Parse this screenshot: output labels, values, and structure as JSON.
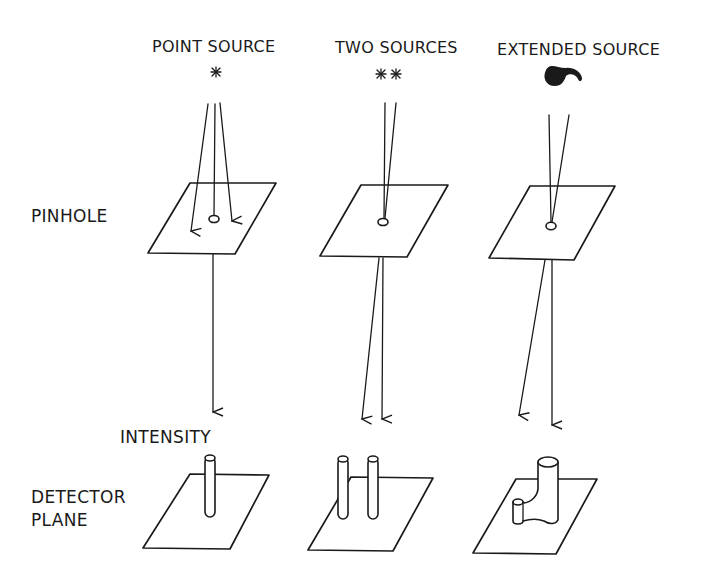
{
  "diagram": {
    "columns": [
      {
        "title": "POINT SOURCE",
        "source_glyph": "✳",
        "source_type": "asterisk-icon"
      },
      {
        "title": "TWO SOURCES",
        "source_glyph": "✳✳",
        "source_type": "double-asterisk-icon"
      },
      {
        "title": "EXTENDED SOURCE",
        "source_glyph": "",
        "source_type": "blob-icon"
      }
    ],
    "row_labels": {
      "pinhole": "PINHOLE",
      "intensity": "INTENSITY",
      "detector_line1": "DETECTOR",
      "detector_line2": "PLANE"
    },
    "colors": {
      "ink": "#1a1a1a",
      "background": "#ffffff"
    }
  }
}
